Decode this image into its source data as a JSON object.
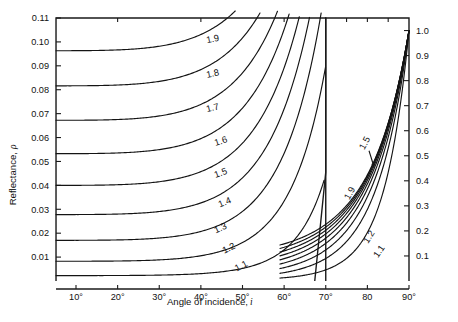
{
  "chart_data": {
    "type": "line",
    "title": "",
    "subtitle": "",
    "xlabel": "Angle of incidence, i",
    "ylabel": "Reflectance, ρ",
    "ylabel_main": "Reflectance,",
    "ylabel_symbol": "ρ",
    "xlabel_main": "Angle of incidence,",
    "xlabel_symbol": "i",
    "grid": false,
    "legend": "none",
    "panels": [
      {
        "name": "left-panel",
        "xlim": [
          5,
          70
        ],
        "ylim": [
          0,
          0.11
        ],
        "xticks": [
          10,
          20,
          30,
          40,
          50,
          60,
          70
        ],
        "xticklabels": [
          "10°",
          "20°",
          "30°",
          "40°",
          "50°",
          "60°",
          "70°"
        ],
        "yticks": [
          0.01,
          0.02,
          0.03,
          0.04,
          0.05,
          0.06,
          0.07,
          0.08,
          0.09,
          0.1,
          0.11
        ],
        "yticklabels": [
          "0.01",
          "0.02",
          "0.03",
          "0.04",
          "0.05",
          "0.06",
          "0.07",
          "0.08",
          "0.09",
          "0.10",
          "0.11"
        ],
        "y_axis_side": "left"
      },
      {
        "name": "right-panel",
        "xlim": [
          70,
          90
        ],
        "ylim": [
          0,
          1.05
        ],
        "xticks": [
          70,
          80,
          90
        ],
        "xticklabels": [
          "70°",
          "80",
          "90°"
        ],
        "yticks": [
          0.1,
          0.2,
          0.3,
          0.4,
          0.5,
          0.6,
          0.7,
          0.8,
          0.9,
          1.0
        ],
        "yticklabels": [
          "0.1",
          "0.2",
          "0.3",
          "0.4",
          "0.5",
          "0.6",
          "0.7",
          "0.8",
          "0.9",
          "1.0"
        ],
        "y_axis_side": "right"
      }
    ],
    "series": [
      {
        "name": "1.9",
        "label": "1.9",
        "refractive_index": 1.9,
        "normal_incidence_reflectance": 0.0961
      },
      {
        "name": "1.8",
        "label": "1.8",
        "refractive_index": 1.8,
        "normal_incidence_reflectance": 0.0816
      },
      {
        "name": "1.7",
        "label": "1.7",
        "refractive_index": 1.7,
        "normal_incidence_reflectance": 0.0672
      },
      {
        "name": "1.6",
        "label": "1.6",
        "refractive_index": 1.6,
        "normal_incidence_reflectance": 0.0533
      },
      {
        "name": "1.5",
        "label": "1.5",
        "refractive_index": 1.5,
        "normal_incidence_reflectance": 0.04
      },
      {
        "name": "1.4",
        "label": "1.4",
        "refractive_index": 1.4,
        "normal_incidence_reflectance": 0.0278
      },
      {
        "name": "1.3",
        "label": "1.3",
        "refractive_index": 1.3,
        "normal_incidence_reflectance": 0.017
      },
      {
        "name": "1.2",
        "label": "1.2",
        "refractive_index": 1.2,
        "normal_incidence_reflectance": 0.0083
      },
      {
        "name": "1.1",
        "label": "1.1",
        "refractive_index": 1.1,
        "normal_incidence_reflectance": 0.0023
      }
    ],
    "left_panel_labels": [
      {
        "text": "1.9",
        "x_deg": 43,
        "y_val": 0.1,
        "rotation": -12
      },
      {
        "text": "1.8",
        "x_deg": 43,
        "y_val": 0.0855,
        "rotation": -12
      },
      {
        "text": "1.7",
        "x_deg": 43,
        "y_val": 0.0712,
        "rotation": -14
      },
      {
        "text": "1.6",
        "x_deg": 45,
        "y_val": 0.0573,
        "rotation": -18
      },
      {
        "text": "1.5",
        "x_deg": 45,
        "y_val": 0.044,
        "rotation": -20
      },
      {
        "text": "1.4",
        "x_deg": 46,
        "y_val": 0.0318,
        "rotation": -22
      },
      {
        "text": "1.3",
        "x_deg": 45,
        "y_val": 0.021,
        "rotation": -24
      },
      {
        "text": "1.2",
        "x_deg": 47,
        "y_val": 0.0126,
        "rotation": -26
      },
      {
        "text": "1.1",
        "x_deg": 50,
        "y_val": 0.0052,
        "rotation": -28
      }
    ],
    "right_panel_labels": [
      {
        "text": "1.5",
        "x_deg": 80.0,
        "y_val": 0.545,
        "rotation": -62
      },
      {
        "text": "1.9",
        "x_deg": 76.4,
        "y_val": 0.345,
        "rotation": -62
      },
      {
        "text": "1.2",
        "x_deg": 81.0,
        "y_val": 0.17,
        "rotation": -58
      },
      {
        "text": "1.1",
        "x_deg": 83.4,
        "y_val": 0.112,
        "rotation": -56
      }
    ],
    "annotations": [
      {
        "type": "arrow",
        "name": "label-1.5-pointer",
        "from_x_deg": 80.4,
        "from_y": 0.52,
        "to_x_deg": 81.6,
        "to_y": 0.455
      }
    ],
    "axis_break": {
      "present": true,
      "location_deg": 70,
      "style": "broken-slanted-edge"
    }
  }
}
